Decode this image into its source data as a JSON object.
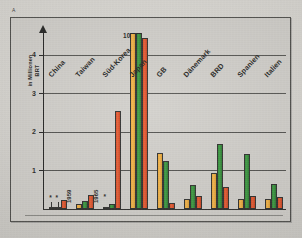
{
  "figure": {
    "marker": "A",
    "border_color": "#4a4a47",
    "background_color": "#d2d0cb"
  },
  "chart_data": {
    "type": "bar",
    "title": "",
    "subtitle": "",
    "xlabel": "",
    "ylabel": "in Millionen\nBRT",
    "ylabel_lines": [
      "in Millionen",
      "BRT"
    ],
    "ylim": [
      0,
      4.6
    ],
    "yticks": [
      "1",
      "2",
      "3",
      "4"
    ],
    "ytick_values": [
      1,
      2,
      3,
      4
    ],
    "grid": true,
    "grid_axis": "y",
    "legend": "none",
    "legend_position": "none",
    "axis_break": true,
    "axis_break_note": "Japan bars clipped at top of scale; true value annotated",
    "categories": [
      "China",
      "Taiwan",
      "Süd-Korea",
      "Japan",
      "GB",
      "Dänemark",
      "BRD",
      "Spanien",
      "Italien"
    ],
    "series": [
      {
        "name": "series-1",
        "color": "#f0a93a",
        "values": [
          0.03,
          0.12,
          0.05,
          4.65,
          1.45,
          0.25,
          0.93,
          0.26,
          0.24
        ]
      },
      {
        "name": "series-2",
        "color": "#2e8b34",
        "values": [
          0.03,
          0.2,
          0.11,
          4.7,
          1.24,
          0.6,
          1.68,
          1.43,
          0.65
        ]
      },
      {
        "name": "series-3",
        "color": "#df4a24",
        "values": [
          0.23,
          0.36,
          2.55,
          4.45,
          0.14,
          0.33,
          0.55,
          0.33,
          0.29
        ]
      }
    ],
    "annotations": [
      {
        "id": "ann-japan-value",
        "text": "10",
        "category": "Japan",
        "kind": "value-label"
      },
      {
        "id": "ann-star-china-1",
        "text": "*",
        "category": "China",
        "kind": "footnote-marker"
      },
      {
        "id": "ann-star-china-2",
        "text": "*",
        "category": "China",
        "kind": "footnote-marker"
      },
      {
        "id": "ann-star-suedkorea",
        "text": "*",
        "category": "Süd-Korea",
        "kind": "footnote-marker"
      },
      {
        "id": "ann-year-1959",
        "text": "1959",
        "category": "Taiwan",
        "kind": "year-label"
      },
      {
        "id": "ann-year-1965",
        "text": "1965",
        "category": "Süd-Korea",
        "kind": "year-label"
      }
    ],
    "colors": {
      "series_1": "#f0a93a",
      "series_2": "#2e8b34",
      "series_3": "#df4a24",
      "axis": "#1f1f1e",
      "grid": "#3a3a37",
      "background": "#d2d0cb"
    }
  }
}
